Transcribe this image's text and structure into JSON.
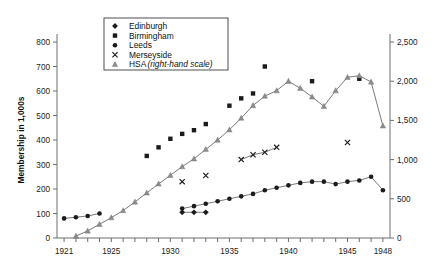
{
  "chart_data": {
    "type": "line",
    "title": "",
    "xlabel": "",
    "ylabel": "Membership in 1,000s",
    "y2label": "",
    "xlim": [
      1920.4,
      1948.6
    ],
    "ylim": [
      0,
      800
    ],
    "y2lim": [
      0,
      2500
    ],
    "grid": false,
    "legend_position": "top-left-inside",
    "x_ticks_labeled": [
      "1921",
      "1925",
      "1930",
      "1935",
      "1940",
      "1945",
      "1948"
    ],
    "x_ticks_labeled_values": [
      1921,
      1925,
      1930,
      1935,
      1940,
      1945,
      1948
    ],
    "y_ticks": [
      "0",
      "100",
      "200",
      "300",
      "400",
      "500",
      "600",
      "700",
      "800"
    ],
    "y_tick_values": [
      0,
      100,
      200,
      300,
      400,
      500,
      600,
      700,
      800
    ],
    "y2_ticks": [
      "0",
      "500",
      "1,000",
      "1,500",
      "2,000",
      "2,500"
    ],
    "y2_tick_values": [
      0,
      500,
      1000,
      1500,
      2000,
      2500
    ],
    "series": [
      {
        "name": "Edinburgh",
        "marker": "diamond",
        "axis": "left",
        "connected": true,
        "x": [
          1931,
          1932,
          1933
        ],
        "values": [
          105,
          105,
          105
        ]
      },
      {
        "name": "Birmingham",
        "marker": "square",
        "axis": "left",
        "connected": false,
        "x": [
          1928,
          1929,
          1930,
          1931,
          1932,
          1933,
          1935,
          1936,
          1937,
          1938,
          1942,
          1946
        ],
        "values": [
          335,
          370,
          405,
          425,
          440,
          465,
          540,
          570,
          590,
          700,
          640,
          650
        ]
      },
      {
        "name": "Leeds",
        "marker": "circle",
        "axis": "left",
        "connected": true,
        "x": [
          1921,
          1922,
          1923,
          1924,
          1931,
          1932,
          1933,
          1934,
          1935,
          1936,
          1937,
          1938,
          1939,
          1940,
          1941,
          1942,
          1943,
          1944,
          1945,
          1946,
          1947,
          1948
        ],
        "values": [
          80,
          85,
          90,
          100,
          120,
          130,
          140,
          150,
          160,
          170,
          180,
          195,
          205,
          215,
          225,
          230,
          230,
          220,
          230,
          235,
          250,
          195
        ]
      },
      {
        "name": "Merseyside",
        "marker": "x",
        "axis": "left",
        "connected": true,
        "x": [
          1936,
          1937,
          1938,
          1939
        ],
        "values": [
          320,
          340,
          350,
          370
        ],
        "isolated_points": [
          {
            "x": 1931,
            "value": 230
          },
          {
            "x": 1933,
            "value": 255
          },
          {
            "x": 1945,
            "value": 390
          }
        ]
      },
      {
        "name": "HSA",
        "note": "(right-hand scale)",
        "marker": "triangle",
        "axis": "right",
        "connected": true,
        "x": [
          1922,
          1923,
          1924,
          1925,
          1926,
          1927,
          1928,
          1929,
          1930,
          1931,
          1932,
          1933,
          1934,
          1935,
          1936,
          1937,
          1938,
          1939,
          1940,
          1941,
          1942,
          1943,
          1944,
          1945,
          1946,
          1947,
          1948
        ],
        "values": [
          25,
          90,
          175,
          260,
          350,
          460,
          575,
          690,
          800,
          910,
          1010,
          1130,
          1250,
          1380,
          1530,
          1690,
          1810,
          1880,
          2000,
          1910,
          1800,
          1680,
          1880,
          2050,
          2070,
          1990,
          1430
        ]
      }
    ]
  },
  "legend": {
    "items": [
      {
        "label": "Edinburgh",
        "marker": "diamond",
        "note": ""
      },
      {
        "label": "Birmingham",
        "marker": "square",
        "note": ""
      },
      {
        "label": "Leeds",
        "marker": "circle",
        "note": ""
      },
      {
        "label": "Merseyside",
        "marker": "x",
        "note": ""
      },
      {
        "label": "HSA",
        "marker": "triangle",
        "note": "(right-hand scale)"
      }
    ]
  },
  "axes": {
    "left_title": "Membership in 1,000s"
  }
}
